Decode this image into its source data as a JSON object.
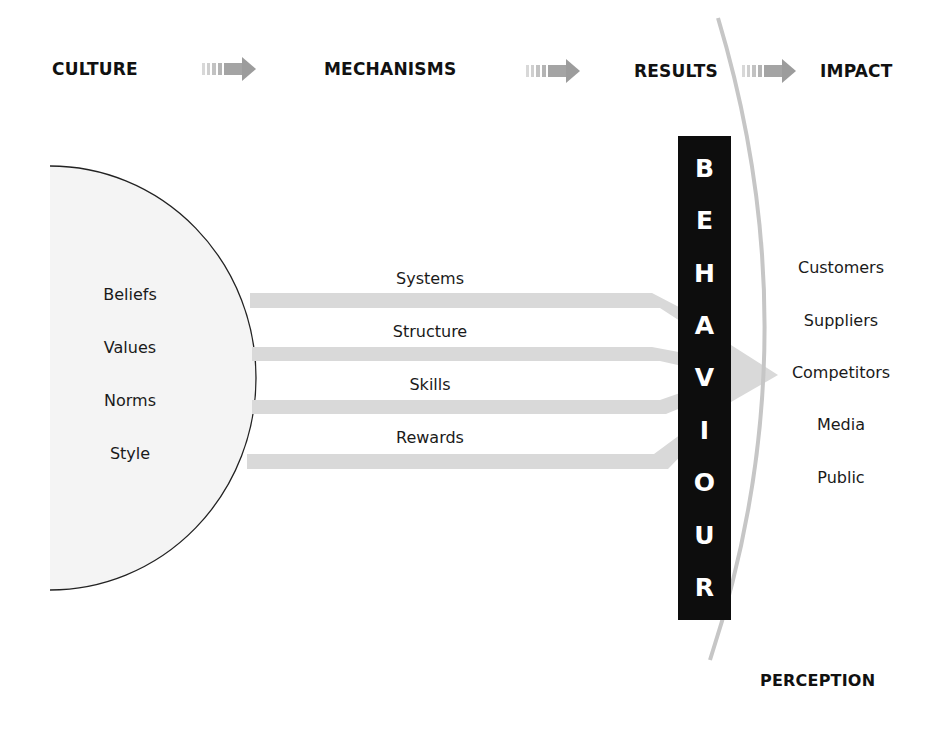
{
  "headers": {
    "culture": "CULTURE",
    "mechanisms": "MECHANISMS",
    "results": "RESULTS",
    "impact": "IMPACT",
    "perception": "PERCEPTION"
  },
  "culture_items": [
    "Beliefs",
    "Values",
    "Norms",
    "Style"
  ],
  "mechanism_items": [
    "Systems",
    "Structure",
    "Skills",
    "Rewards"
  ],
  "behaviour_letters": [
    "B",
    "E",
    "H",
    "A",
    "V",
    "I",
    "O",
    "U",
    "R"
  ],
  "impact_items": [
    "Customers",
    "Suppliers",
    "Competitors",
    "Media",
    "Public"
  ],
  "colors": {
    "ellipse_fill": "#f4f4f4",
    "band": "#d9d9d9",
    "arrow": "#9a9a9a",
    "behaviour_bg": "#0d0d0d",
    "arc": "#c8c8c8"
  }
}
